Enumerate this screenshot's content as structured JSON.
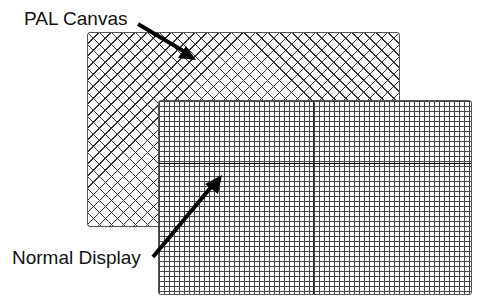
{
  "labels": {
    "pal_canvas": "PAL Canvas",
    "normal_display": "Normal Display"
  },
  "shapes": {
    "pal_canvas_rect": {
      "pattern": "diagonal-crosshatch"
    },
    "normal_display_rect": {
      "pattern": "square-grid"
    }
  },
  "colors": {
    "background": "#ffffff",
    "lines": "#333333",
    "arrow": "#000000"
  }
}
